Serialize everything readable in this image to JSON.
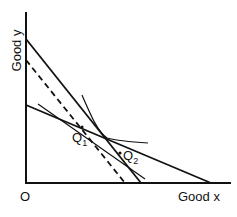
{
  "diagram": {
    "axes": {
      "y_label": "Good y",
      "x_label": "Good x",
      "origin_label": "O"
    },
    "points": {
      "q1": {
        "label": "Q",
        "sub": "1"
      },
      "q2": {
        "label": "Q",
        "sub": "2"
      }
    },
    "lines": [
      {
        "name": "budget-line-steep",
        "style": "solid"
      },
      {
        "name": "budget-line-shifted",
        "style": "dashed"
      },
      {
        "name": "budget-line-flat",
        "style": "solid"
      },
      {
        "name": "tangent-line",
        "style": "solid-thin"
      },
      {
        "name": "indifference-curve",
        "style": "curve"
      }
    ]
  }
}
